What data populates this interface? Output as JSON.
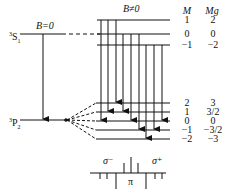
{
  "labels": {
    "b_zero": "B=0",
    "b_nonzero": "B≠0",
    "upper_term_sup": "3",
    "upper_term_letter": "S",
    "upper_term_sub": "1",
    "lower_term_sup": "3",
    "lower_term_letter": "P",
    "lower_term_sub": "2",
    "col_M": "M",
    "col_Mg": "Mg",
    "sigma_minus": "σ⁻",
    "sigma_plus": "σ⁺",
    "pi": "π"
  },
  "upper_levels": [
    {
      "M": "1",
      "Mg": "2",
      "y": 20
    },
    {
      "M": "0",
      "Mg": "0",
      "y": 34
    },
    {
      "M": "−1",
      "Mg": "−2",
      "y": 45
    }
  ],
  "lower_levels": [
    {
      "M": "2",
      "Mg": "3",
      "y": 103
    },
    {
      "M": "1",
      "Mg": "3/2",
      "y": 112
    },
    {
      "M": "0",
      "Mg": "0",
      "y": 121
    },
    {
      "M": "−1",
      "Mg": "−3/2",
      "y": 130
    },
    {
      "M": "−2",
      "Mg": "−3",
      "y": 139
    }
  ],
  "transitions": [
    {
      "x": 101,
      "from": 0,
      "to": 2,
      "type": "sigma-"
    },
    {
      "x": 108,
      "from": 0,
      "to": 1,
      "type": "pi"
    },
    {
      "x": 116,
      "from": 0,
      "to": 0,
      "type": "sigma+"
    },
    {
      "x": 123,
      "from": 1,
      "to": 1,
      "type": "sigma-"
    },
    {
      "x": 131,
      "from": 1,
      "to": 2,
      "type": "pi"
    },
    {
      "x": 139,
      "from": 1,
      "to": 3,
      "type": "sigma+"
    },
    {
      "x": 146,
      "from": 2,
      "to": 4,
      "type": "sigma-"
    },
    {
      "x": 154,
      "from": 2,
      "to": 3,
      "type": "pi"
    },
    {
      "x": 162,
      "from": 2,
      "to": 2,
      "type": "sigma+"
    }
  ],
  "spectrum": [
    {
      "x": 100,
      "dir": "down",
      "len": 6
    },
    {
      "x": 107,
      "dir": "down",
      "len": 6
    },
    {
      "x": 116,
      "dir": "down",
      "len": 16
    },
    {
      "x": 124,
      "dir": "up",
      "len": 10
    },
    {
      "x": 131,
      "dir": "up",
      "len": 16
    },
    {
      "x": 138,
      "dir": "up",
      "len": 10
    },
    {
      "x": 146,
      "dir": "down",
      "len": 16
    },
    {
      "x": 155,
      "dir": "down",
      "len": 6
    },
    {
      "x": 162,
      "dir": "down",
      "len": 6
    }
  ]
}
